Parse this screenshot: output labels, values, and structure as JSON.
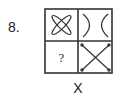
{
  "question": {
    "number_label": "8.",
    "caption": "X",
    "grid": {
      "rows": 2,
      "cols": 2,
      "cells": [
        {
          "position": "top-left",
          "figure": "petal-x-icon",
          "description": "four elongated loops forming an X"
        },
        {
          "position": "top-right",
          "figure": "curved-x-icon",
          "description": "two curves touching at center forming an X"
        },
        {
          "position": "bottom-left",
          "figure": "question-mark",
          "text": "?"
        },
        {
          "position": "bottom-right",
          "figure": "straight-x-icon",
          "description": "two straight diagonal lines with dotted ends"
        }
      ]
    },
    "colors": {
      "stroke": "#333333",
      "background": "#ffffff"
    }
  }
}
